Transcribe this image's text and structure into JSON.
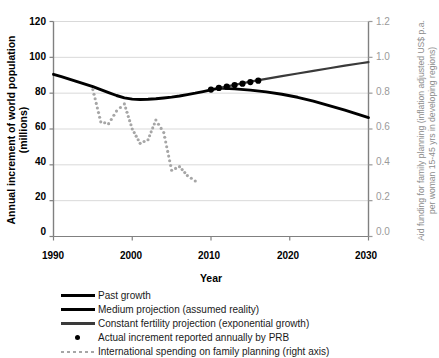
{
  "chart_data": {
    "type": "line",
    "title": "",
    "xlabel": "Year",
    "ylabel": "Annual increment of world population (millions)",
    "ylabel_right": "Aid funding for family planning (inflation adjusted US$ p.a. per woman 15-45 yrs in developing regions)",
    "xlim": [
      1990,
      2030
    ],
    "ylim": [
      0,
      120
    ],
    "ylim_right": [
      0.0,
      1.2
    ],
    "xticks": [
      "1990",
      "2000",
      "2010",
      "2020",
      "2030"
    ],
    "yticks": [
      "0",
      "20",
      "40",
      "60",
      "80",
      "100",
      "120"
    ],
    "yticks_right": [
      "0.0",
      "0.2",
      "0.4",
      "0.6",
      "0.8",
      "1.0",
      "1.2"
    ],
    "grid": "horizontal",
    "legend_position": "below-axes",
    "series": [
      {
        "name": "Past growth",
        "axis": "left",
        "style": "solid-thick",
        "color": "#000000",
        "x": [
          1990,
          1991,
          1992,
          1993,
          1994,
          1995,
          1996,
          1997,
          1998,
          1999,
          2000,
          2001,
          2002,
          2003,
          2004,
          2005,
          2006,
          2007,
          2008,
          2009,
          2010,
          2011
        ],
        "values": [
          90.5,
          89.2,
          87.8,
          86.4,
          85.0,
          83.6,
          82.0,
          80.3,
          78.7,
          77.4,
          76.7,
          76.5,
          76.6,
          76.9,
          77.3,
          77.8,
          78.4,
          79.2,
          80.0,
          80.9,
          81.8,
          82.8
        ]
      },
      {
        "name": "Medium projection (assumed reality)",
        "axis": "left",
        "style": "solid-thick",
        "color": "#000000",
        "x": [
          2011,
          2013,
          2015,
          2017,
          2019,
          2021,
          2023,
          2025,
          2027,
          2029,
          2030
        ],
        "values": [
          82.8,
          82.4,
          81.7,
          80.7,
          79.4,
          77.7,
          75.6,
          73.1,
          70.5,
          67.7,
          66.4
        ]
      },
      {
        "name": "Constant fertility projection (exponential growth)",
        "axis": "left",
        "style": "solid-medium",
        "color": "#3a3a3a",
        "x": [
          2011,
          2013,
          2015,
          2017,
          2019,
          2021,
          2023,
          2025,
          2027,
          2029,
          2030
        ],
        "values": [
          82.8,
          84.6,
          86.4,
          88.0,
          89.5,
          91.0,
          92.4,
          93.9,
          95.4,
          96.7,
          97.3
        ]
      },
      {
        "name": "Actual increment reported annually by PRB",
        "axis": "left",
        "style": "markers",
        "color": "#000000",
        "x": [
          2010,
          2011,
          2012,
          2013,
          2014,
          2015,
          2016
        ],
        "values": [
          82.0,
          82.9,
          83.6,
          84.5,
          85.3,
          86.2,
          87.0
        ]
      },
      {
        "name": "International spending on family planning (right axis)",
        "axis": "right",
        "style": "dotted",
        "color": "#a6a6a6",
        "x": [
          1995,
          1996,
          1997,
          1998,
          1999,
          2000,
          2001,
          2002,
          2003,
          2004,
          2005,
          2006,
          2007,
          2008
        ],
        "values": [
          0.82,
          0.64,
          0.63,
          0.7,
          0.74,
          0.6,
          0.52,
          0.54,
          0.65,
          0.58,
          0.37,
          0.39,
          0.34,
          0.31
        ]
      }
    ],
    "legend_entries": [
      {
        "label": "Past growth",
        "key": "line-black"
      },
      {
        "label": "Medium projection (assumed reality)",
        "key": "line-black"
      },
      {
        "label": "Constant fertility projection (exponential growth)",
        "key": "line-gray"
      },
      {
        "label": "Actual increment reported annually by PRB",
        "key": "dot-black"
      },
      {
        "label": "International spending on family planning (right axis)",
        "key": "dotted-gray"
      }
    ]
  },
  "axes": {
    "left_title": "Annual increment of world population (millions)",
    "right_title": "Aid funding for family planning (inflation adjusted US$ p.a. per woman 15-45 yrs in developing regions)",
    "x_title": "Year"
  },
  "ticks": {
    "left": [
      "120",
      "100",
      "80",
      "60",
      "40",
      "20",
      "0"
    ],
    "right": [
      "1.2",
      "1.0",
      "0.8",
      "0.6",
      "0.4",
      "0.2",
      "0.0"
    ],
    "x": [
      "1990",
      "2000",
      "2010",
      "2020",
      "2030"
    ]
  },
  "colors": {
    "past_growth": "#000000",
    "constant_fertility": "#3a3a3a",
    "spending_dotted": "#a6a6a6",
    "gridline": "#d9d9d9",
    "right_axis_text": "#9a9a9a"
  }
}
